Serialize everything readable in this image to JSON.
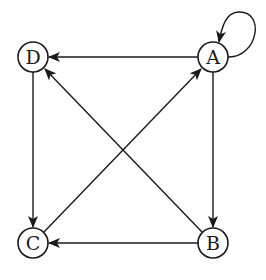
{
  "diagram": {
    "type": "directed-graph",
    "nodes": [
      {
        "id": "A",
        "label": "A",
        "x": 213,
        "y": 57
      },
      {
        "id": "B",
        "label": "B",
        "x": 213,
        "y": 243
      },
      {
        "id": "C",
        "label": "C",
        "x": 33,
        "y": 243
      },
      {
        "id": "D",
        "label": "D",
        "x": 33,
        "y": 57
      }
    ],
    "edges": [
      {
        "from": "A",
        "to": "A",
        "kind": "self-loop"
      },
      {
        "from": "A",
        "to": "D"
      },
      {
        "from": "A",
        "to": "B"
      },
      {
        "from": "B",
        "to": "C"
      },
      {
        "from": "B",
        "to": "D"
      },
      {
        "from": "C",
        "to": "A"
      },
      {
        "from": "D",
        "to": "C"
      }
    ],
    "colors": {
      "stroke": "#1a1a1a",
      "background": "#ffffff"
    }
  }
}
